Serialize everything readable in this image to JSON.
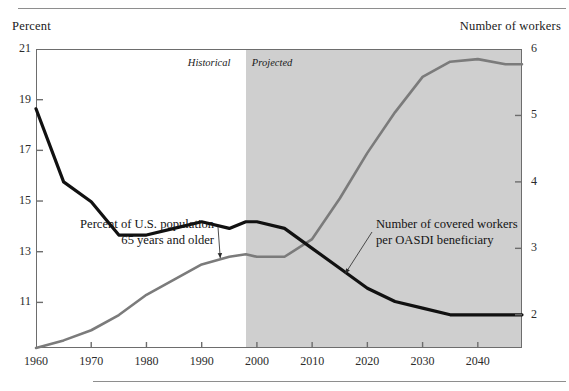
{
  "figure": {
    "left_axis_title": "Percent",
    "right_axis_title": "Number of workers",
    "era_historical": "Historical",
    "era_projected": "Projected",
    "annotation_left": "Percent of U.S. population\n65 years and older",
    "annotation_right": "Number of covered workers\nper OASDI beneficiary",
    "colors": {
      "gray_series": "#7b7b7b",
      "black_series": "#111111",
      "projected_band": "#cfcfcf",
      "frame": "#6d6d6d",
      "rule": "#8e8e8e"
    }
  },
  "chart_data": {
    "type": "line",
    "title": "",
    "xlabel": "",
    "ylabel": "Percent",
    "y2label": "Number of workers",
    "xlim": [
      1960,
      2048
    ],
    "ylim": [
      9.2,
      21
    ],
    "y2lim": [
      1.5,
      6
    ],
    "grid": false,
    "legend": "annotations",
    "xticks": [
      1960,
      1970,
      1980,
      1990,
      2000,
      2010,
      2020,
      2030,
      2040
    ],
    "yticks": [
      11,
      13,
      15,
      17,
      19,
      21
    ],
    "y2ticks": [
      2,
      3,
      4,
      5,
      6
    ],
    "projection_start": 1998,
    "series": [
      {
        "name": "Percent of U.S. population 65 years and older",
        "axis": "left",
        "units": "percent",
        "color": "#7b7b7b",
        "x": [
          1960,
          1965,
          1970,
          1975,
          1980,
          1985,
          1990,
          1995,
          1998,
          2000,
          2005,
          2010,
          2015,
          2020,
          2025,
          2030,
          2035,
          2040,
          2045,
          2048
        ],
        "values": [
          9.2,
          9.5,
          9.9,
          10.5,
          11.3,
          11.9,
          12.5,
          12.8,
          12.9,
          12.8,
          12.8,
          13.5,
          15.1,
          16.9,
          18.5,
          19.9,
          20.5,
          20.6,
          20.4,
          20.4
        ]
      },
      {
        "name": "Number of covered workers per OASDI beneficiary",
        "axis": "right",
        "units": "workers per beneficiary",
        "color": "#111111",
        "x": [
          1960,
          1965,
          1970,
          1975,
          1980,
          1985,
          1990,
          1995,
          1998,
          2000,
          2005,
          2010,
          2015,
          2020,
          2025,
          2030,
          2035,
          2040,
          2045,
          2048
        ],
        "values": [
          5.1,
          4.0,
          3.7,
          3.2,
          3.2,
          3.3,
          3.4,
          3.3,
          3.4,
          3.4,
          3.3,
          3.0,
          2.7,
          2.4,
          2.2,
          2.1,
          2.0,
          2.0,
          2.0,
          2.0
        ]
      }
    ],
    "annotations": [
      {
        "text": "Percent of U.S. population 65 years and older",
        "points_to_series": "Percent of U.S. population 65 years and older"
      },
      {
        "text": "Number of covered workers per OASDI beneficiary",
        "points_to_series": "Number of covered workers per OASDI beneficiary"
      }
    ]
  }
}
